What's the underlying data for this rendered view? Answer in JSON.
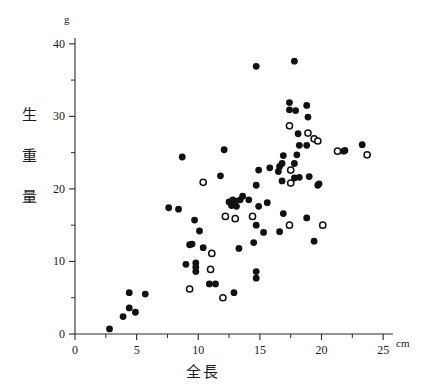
{
  "chart": {
    "title": "",
    "x_axis": {
      "label": "全長",
      "unit": "cm",
      "ticks": [
        0,
        5,
        10,
        15,
        20,
        25
      ],
      "minor_ticks": [
        2.5,
        7.5,
        12.5,
        17.5,
        22.5
      ],
      "min": 0,
      "max": 25.8
    },
    "y_axis": {
      "label_chars": [
        "生",
        "重",
        "量"
      ],
      "unit": "g",
      "ticks": [
        0,
        10,
        20,
        30,
        40
      ],
      "minor_ticks": [
        5,
        15,
        25,
        35
      ],
      "min": 0,
      "max": 40.8
    },
    "legend": {
      "filled_marker": "closed-circle",
      "open_marker": "open-circle"
    },
    "colors": {
      "ink": "#111111",
      "axis": "#2b2b2b",
      "background": "#ffffff"
    }
  },
  "chart_data": {
    "type": "scatter",
    "title": "",
    "xlabel": "全長",
    "ylabel": "生重量",
    "xunit": "cm",
    "yunit": "g",
    "xlim": [
      0,
      25.8
    ],
    "ylim": [
      0,
      40.8
    ],
    "grid": false,
    "legend_position": "none",
    "series": [
      {
        "name": "closed-circle",
        "marker": "filled",
        "points": [
          [
            2.8,
            0.7
          ],
          [
            3.9,
            2.4
          ],
          [
            4.9,
            3.0
          ],
          [
            4.4,
            3.6
          ],
          [
            4.4,
            5.7
          ],
          [
            5.7,
            5.5
          ],
          [
            7.6,
            17.4
          ],
          [
            8.4,
            17.2
          ],
          [
            8.7,
            24.4
          ],
          [
            9.0,
            9.6
          ],
          [
            9.3,
            12.3
          ],
          [
            9.5,
            12.4
          ],
          [
            9.7,
            15.7
          ],
          [
            9.8,
            9.8
          ],
          [
            9.8,
            9.2
          ],
          [
            9.8,
            8.6
          ],
          [
            10.1,
            14.2
          ],
          [
            10.4,
            11.9
          ],
          [
            10.9,
            6.9
          ],
          [
            11.4,
            6.9
          ],
          [
            11.8,
            21.8
          ],
          [
            12.1,
            25.4
          ],
          [
            12.5,
            18.2
          ],
          [
            12.7,
            17.7
          ],
          [
            12.8,
            18.5
          ],
          [
            12.9,
            5.7
          ],
          [
            13.0,
            18.3
          ],
          [
            13.1,
            17.6
          ],
          [
            13.3,
            11.8
          ],
          [
            13.4,
            18.5
          ],
          [
            13.6,
            19.0
          ],
          [
            14.1,
            18.5
          ],
          [
            14.5,
            12.6
          ],
          [
            14.7,
            36.9
          ],
          [
            14.7,
            8.6
          ],
          [
            14.7,
            7.7
          ],
          [
            14.7,
            15.0
          ],
          [
            14.9,
            22.6
          ],
          [
            14.9,
            17.6
          ],
          [
            14.7,
            20.5
          ],
          [
            15.3,
            14.0
          ],
          [
            15.6,
            18.1
          ],
          [
            15.8,
            22.9
          ],
          [
            16.5,
            22.4
          ],
          [
            16.6,
            23.1
          ],
          [
            16.6,
            14.1
          ],
          [
            16.8,
            23.5
          ],
          [
            16.8,
            21.1
          ],
          [
            16.9,
            24.6
          ],
          [
            16.9,
            16.6
          ],
          [
            17.4,
            31.9
          ],
          [
            17.4,
            30.9
          ],
          [
            17.8,
            37.6
          ],
          [
            17.8,
            23.5
          ],
          [
            17.8,
            21.5
          ],
          [
            17.9,
            30.8
          ],
          [
            18.0,
            24.7
          ],
          [
            18.1,
            27.6
          ],
          [
            18.2,
            26.0
          ],
          [
            18.2,
            21.6
          ],
          [
            18.8,
            31.5
          ],
          [
            18.8,
            26.0
          ],
          [
            18.8,
            16.0
          ],
          [
            18.9,
            29.9
          ],
          [
            19.0,
            21.7
          ],
          [
            19.4,
            12.8
          ],
          [
            19.7,
            20.5
          ],
          [
            19.8,
            20.7
          ],
          [
            21.8,
            25.2
          ],
          [
            21.9,
            25.3
          ],
          [
            23.3,
            26.1
          ]
        ]
      },
      {
        "name": "open-circle",
        "marker": "open",
        "points": [
          [
            9.3,
            6.2
          ],
          [
            10.4,
            20.9
          ],
          [
            11.0,
            8.9
          ],
          [
            11.1,
            11.1
          ],
          [
            12.0,
            5.0
          ],
          [
            12.2,
            16.2
          ],
          [
            13.0,
            15.9
          ],
          [
            14.4,
            16.2
          ],
          [
            17.4,
            28.7
          ],
          [
            17.4,
            15.0
          ],
          [
            17.5,
            22.6
          ],
          [
            17.5,
            20.8
          ],
          [
            18.9,
            27.7
          ],
          [
            19.4,
            26.9
          ],
          [
            19.7,
            26.6
          ],
          [
            20.1,
            15.0
          ],
          [
            21.3,
            25.2
          ],
          [
            23.7,
            24.7
          ]
        ]
      }
    ]
  }
}
